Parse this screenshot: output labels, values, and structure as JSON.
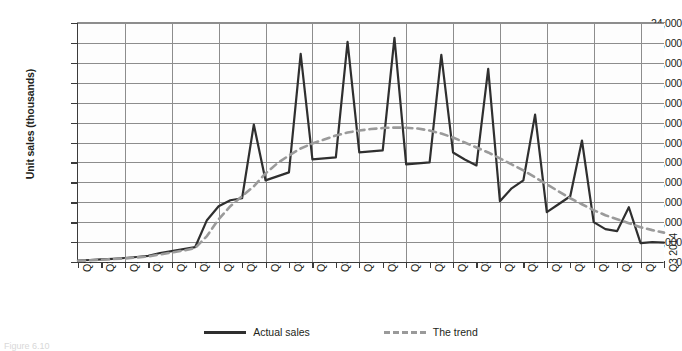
{
  "axis_title_y": "Unit sales (thousands)",
  "legend": [
    {
      "label": "Actual sales",
      "style": "solid",
      "color": "#2f2f2f"
    },
    {
      "label": "The trend",
      "style": "dashed",
      "color": "#9a9a9a"
    }
  ],
  "caption": "Figure 6.10",
  "chart_data": {
    "type": "line",
    "title": "",
    "xlabel": "",
    "ylabel": "Unit sales (thousands)",
    "ylim": [
      0,
      24000
    ],
    "ytick_step": 2000,
    "ytick_labels": [
      "0",
      "2,000",
      "4,000",
      "6,000",
      "8,000",
      "10,000",
      "12,000",
      "14,000",
      "16,000",
      "18,000",
      "20,000",
      "22,000",
      "24,000"
    ],
    "grid": true,
    "legend_position": "bottom-center",
    "xtick_labels": [
      "Q1 2002",
      "Q3 2002",
      "Q1 2003",
      "Q3 2003",
      "Q1 2004",
      "Q3 2004",
      "Q1 2005",
      "Q3 2005",
      "Q1 2006",
      "Q3 2006",
      "Q1 2007",
      "Q3 2007",
      "Q1 2008",
      "Q3 2008",
      "Q1 2009",
      "Q3 2009",
      "Q1 2010",
      "Q3 2010",
      "Q1 2011",
      "Q3 2011",
      "Q1 2012",
      "Q3 2012",
      "Q1 2013",
      "Q3 2013",
      "Q1 2014",
      "Q3 2014"
    ],
    "x": [
      "Q1 2002",
      "Q2 2002",
      "Q3 2002",
      "Q4 2002",
      "Q1 2003",
      "Q2 2003",
      "Q3 2003",
      "Q4 2003",
      "Q1 2004",
      "Q2 2004",
      "Q3 2004",
      "Q4 2004",
      "Q1 2005",
      "Q2 2005",
      "Q3 2005",
      "Q4 2005",
      "Q1 2006",
      "Q2 2006",
      "Q3 2006",
      "Q4 2006",
      "Q1 2007",
      "Q2 2007",
      "Q3 2007",
      "Q4 2007",
      "Q1 2008",
      "Q2 2008",
      "Q3 2008",
      "Q4 2008",
      "Q1 2009",
      "Q2 2009",
      "Q3 2009",
      "Q4 2009",
      "Q1 2010",
      "Q2 2010",
      "Q3 2010",
      "Q4 2010",
      "Q1 2011",
      "Q2 2011",
      "Q3 2011",
      "Q4 2011",
      "Q1 2012",
      "Q2 2012",
      "Q3 2012",
      "Q4 2012",
      "Q1 2013",
      "Q2 2013",
      "Q3 2013",
      "Q4 2013",
      "Q1 2014",
      "Q2 2014",
      "Q3 2014"
    ],
    "series": [
      {
        "name": "Actual sales",
        "style": "solid",
        "color": "#2f2f2f",
        "values": [
          150,
          200,
          260,
          320,
          400,
          500,
          620,
          900,
          1100,
          1300,
          1500,
          4200,
          5600,
          6200,
          6400,
          13800,
          8200,
          8600,
          9000,
          20900,
          10300,
          10400,
          10500,
          22100,
          11000,
          11100,
          11200,
          22500,
          9800,
          9900,
          10000,
          20800,
          11000,
          10300,
          9700,
          19400,
          6100,
          7400,
          8200,
          14800,
          5000,
          5800,
          6600,
          12200,
          4000,
          3300,
          3100,
          5500,
          1900,
          2000,
          1950
        ]
      },
      {
        "name": "The trend",
        "style": "dashed",
        "color": "#9a9a9a",
        "values": [
          120,
          170,
          230,
          290,
          360,
          450,
          560,
          760,
          950,
          1150,
          1400,
          2600,
          4300,
          5600,
          6600,
          7600,
          8900,
          9900,
          10700,
          11400,
          11900,
          12300,
          12700,
          13000,
          13200,
          13350,
          13450,
          13500,
          13480,
          13400,
          13200,
          12900,
          12500,
          12000,
          11500,
          11000,
          10400,
          9800,
          9200,
          8500,
          7800,
          7100,
          6400,
          5800,
          5200,
          4700,
          4300,
          3900,
          3500,
          3200,
          2950
        ]
      }
    ]
  }
}
